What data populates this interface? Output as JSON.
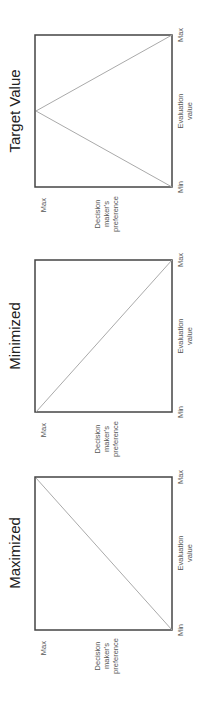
{
  "diagram": {
    "orientation": "rotated-90-ccw",
    "line_color": "#aaaaaa",
    "frame_color": "#444444",
    "panels": [
      {
        "id": "target",
        "title": "Target Value",
        "x_axis": {
          "label_line1": "Evaluation",
          "label_line2": "value",
          "min": "Min",
          "max": "Max"
        },
        "y_axis": {
          "label_line1": "Decision",
          "label_line2": "maker's",
          "label_line3": "preference",
          "max": "Max"
        },
        "shape": "peak at middle evaluation value",
        "points": [
          [
            0,
            0
          ],
          [
            0.5,
            1
          ],
          [
            1,
            0
          ]
        ]
      },
      {
        "id": "minimized",
        "title": "Minimized",
        "x_axis": {
          "label_line1": "Evaluation",
          "label_line2": "value",
          "min": "Min",
          "max": "Max"
        },
        "y_axis": {
          "label_line1": "Decision",
          "label_line2": "maker's",
          "label_line3": "preference",
          "max": "Max"
        },
        "shape": "decreasing line",
        "points": [
          [
            0,
            1
          ],
          [
            1,
            0
          ]
        ]
      },
      {
        "id": "maximized",
        "title": "Maximized",
        "x_axis": {
          "label_line1": "Evaluation",
          "label_line2": "value",
          "min": "Min",
          "max": "Max"
        },
        "y_axis": {
          "label_line1": "Decision",
          "label_line2": "maker's",
          "label_line3": "preference",
          "max": "Max"
        },
        "shape": "increasing line",
        "points": [
          [
            0,
            0
          ],
          [
            1,
            1
          ]
        ]
      }
    ]
  }
}
